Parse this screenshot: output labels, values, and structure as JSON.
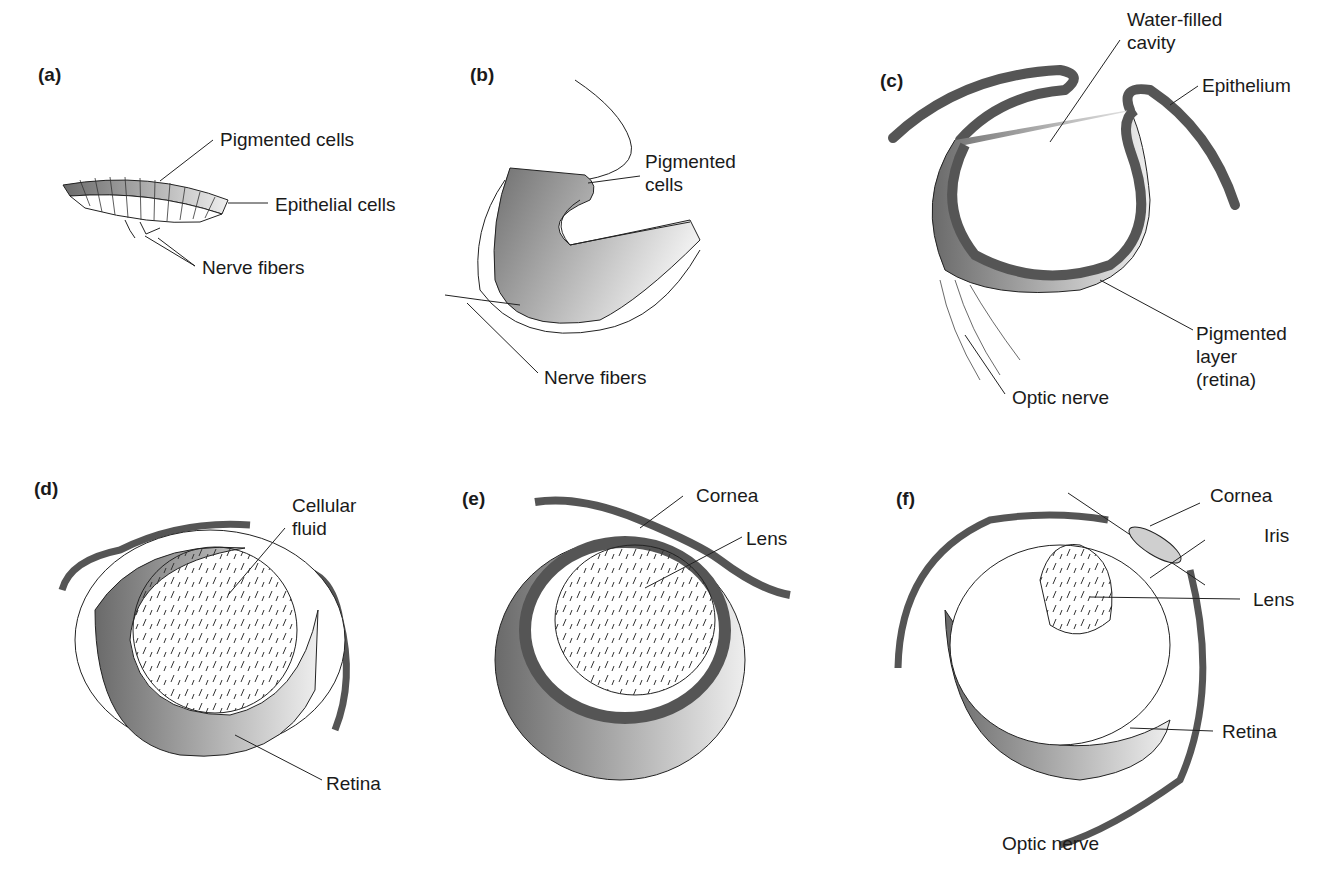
{
  "figure": {
    "colors": {
      "epithelium": "#555555",
      "pigment_dark": "#6e6e6e",
      "pigment_light": "#e6e6e6",
      "line": "#1a1a1a"
    },
    "panels": [
      {
        "id": "a",
        "letter": "(a)",
        "labels": [
          "Pigmented cells",
          "Epithelial cells",
          "Nerve fibers"
        ]
      },
      {
        "id": "b",
        "letter": "(b)",
        "labels": [
          "Pigmented\ncells",
          "Nerve fibers"
        ]
      },
      {
        "id": "c",
        "letter": "(c)",
        "labels": [
          "Water-filled\ncavity",
          "Epithelium",
          "Pigmented\nlayer\n(retina)",
          "Optic nerve"
        ]
      },
      {
        "id": "d",
        "letter": "(d)",
        "labels": [
          "Cellular\nfluid",
          "Retina"
        ]
      },
      {
        "id": "e",
        "letter": "(e)",
        "labels": [
          "Cornea",
          "Lens"
        ]
      },
      {
        "id": "f",
        "letter": "(f)",
        "labels": [
          "Cornea",
          "Iris",
          "Lens",
          "Retina",
          "Optic nerve"
        ]
      }
    ]
  }
}
